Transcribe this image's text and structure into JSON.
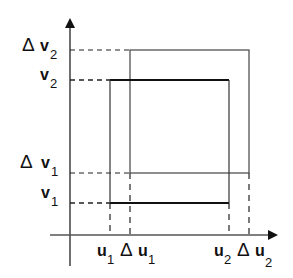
{
  "diagram": {
    "type": "rectangle-displacement",
    "axes": {
      "x_axis": {
        "name": "u",
        "arrow": true
      },
      "y_axis": {
        "name": "v",
        "arrow": true
      }
    },
    "rectangles": [
      {
        "name": "original",
        "u_range": [
          "u1",
          "u2"
        ],
        "v_range": [
          "v1",
          "v2"
        ],
        "stroke": "#111111",
        "weight": "bold"
      },
      {
        "name": "shifted",
        "u_range": [
          "Δu1",
          "Δu2"
        ],
        "v_range": [
          "Δv1",
          "Δv2"
        ],
        "stroke": "#444444",
        "weight": "thin"
      }
    ],
    "y_labels": [
      {
        "delta": "Δ",
        "base": "v",
        "sub": "2"
      },
      {
        "delta": "",
        "base": "v",
        "sub": "2"
      },
      {
        "delta": "Δ",
        "base": "v",
        "sub": "1"
      },
      {
        "delta": "",
        "base": "v",
        "sub": "1"
      }
    ],
    "x_labels": [
      {
        "delta": "",
        "base": "u",
        "sub": "1"
      },
      {
        "delta": "Δ",
        "base": "u",
        "sub": "1"
      },
      {
        "delta": "",
        "base": "u",
        "sub": "2"
      },
      {
        "delta": "Δ",
        "base": "u",
        "sub": "2"
      }
    ]
  }
}
